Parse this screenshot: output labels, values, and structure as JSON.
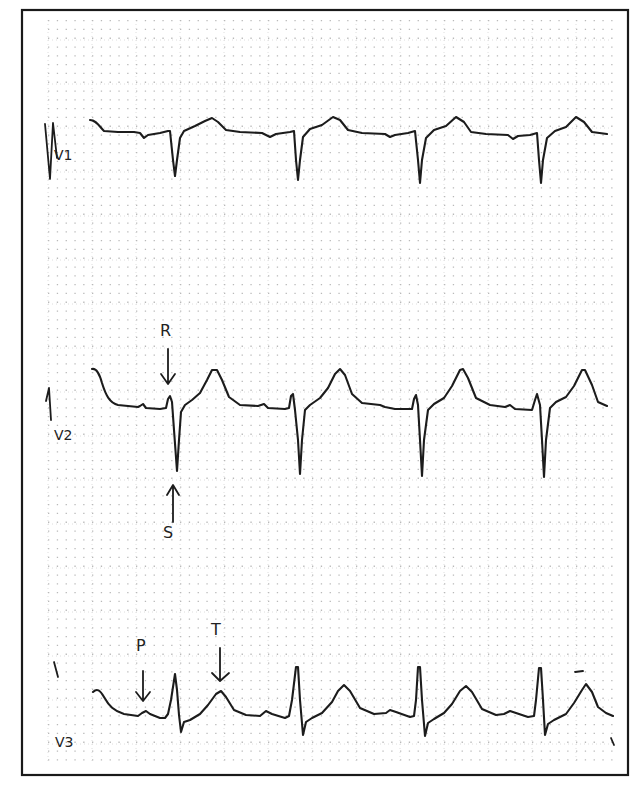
{
  "figure": {
    "type": "ecg-strip",
    "colors": {
      "trace": "#1c1c1c",
      "grid_dot": "#b9b9b9",
      "grid_major": "#d6d6d6",
      "frame": "#1a1a1a",
      "background": "#ffffff"
    },
    "frame": {
      "x": 22,
      "y": 10,
      "w": 606,
      "h": 765
    },
    "grid": {
      "x0": 48,
      "y0": 20,
      "x1": 612,
      "y1": 764,
      "minor": 8.8,
      "major": 44
    }
  },
  "leads": [
    {
      "id": "V1",
      "label": "V1",
      "label_pos": [
        54,
        160
      ],
      "calibration": "M45 124 L50 179 L53 123 L57 158",
      "path": "M90 120 C96 120 99 126 104 131 L118 132 L134 132 L140 133 L144 138 L148 135 L160 133 L168 131 L170 131 L173 160 L175 176 L177 160 L180 138 L184 131 L195 126 L205 121 L212 118 L218 122 L226 130 L240 132 L262 133 L270 137 L276 134 L290 132 L294 131 L296 160 L298 180 L300 160 L303 137 L310 129 L322 125 L333 117 L340 120 L348 130 L362 133 L385 134 L390 137 L395 135 L408 133 L415 131 L418 160 L420 183 L422 160 L426 138 L434 130 L446 126 L456 117 L464 122 L471 132 L486 134 L508 135 L513 139 L518 136 L530 135 L537 133 L539 160 L541 183 L543 160 L547 138 L555 131 L566 127 L576 117 L584 122 L592 132 L607 134"
    },
    {
      "id": "V2",
      "label": "V2",
      "label_pos": [
        54,
        440
      ],
      "calibration": "M46 401 L49 388 L51 420",
      "path": "M92 369 C96 368 99 372 102 383 C106 396 110 403 118 405 L138 407 L140 406 L143 404 L146 408 L160 409 L166 408 L168 399 L170 396 L172 402 L174 430 L177 471 L179 440 L181 412 L185 405 L192 400 L200 393 L207 380 L212 370 L217 370 L222 380 L229 397 L240 405 L258 406 L264 404 L268 408 L285 409 L289 408 L291 396 L293 394 L295 410 L298 440 L300 474 L302 440 L305 410 L310 405 L320 398 L328 388 L335 374 L340 369 L345 375 L352 394 L362 403 L380 405 L385 407 L395 409 L412 409 L414 399 L416 395 L418 405 L420 440 L422 476 L424 440 L428 410 L434 404 L444 398 L452 386 L460 370 L463 369 L468 378 L476 398 L490 405 L505 407 L510 405 L515 409 L532 410 L535 400 L537 394 L540 405 L542 440 L544 477 L546 440 L550 408 L556 402 L566 397 L574 386 L582 370 L585 370 L592 385 L598 402 L607 406"
    },
    {
      "id": "V3",
      "label": "V3",
      "label_pos": [
        55,
        747
      ],
      "calibration": "M54 662 L58 677",
      "path": "M93 692 C97 688 100 690 104 697 C109 706 114 711 124 714 L138 716 L142 713 L146 711 L150 714 L160 718 L165 718 L168 714 L171 700 L175 674 L177 690 L179 715 L181 732 L184 722 L190 720 L200 714 L208 705 L216 694 L221 691 L226 697 L234 710 L246 715 L260 716 L266 711 L272 714 L285 718 L289 716 L292 700 L296 667 L298 667 L300 700 L303 735 L306 722 L312 718 L322 713 L332 702 L338 691 L344 685 L350 691 L360 708 L374 714 L386 713 L390 710 L396 712 L410 717 L414 716 L416 700 L418 667 L420 667 L422 700 L425 736 L428 723 L434 719 L444 713 L452 704 L460 691 L466 686 L472 692 L482 709 L496 715 L504 714 L510 711 L516 713 L528 717 L534 716 L536 700 L539 668 L541 668 L543 700 L545 735 L548 724 L554 720 L566 714 L574 703 L582 690 L586 684 L592 692 L598 707 L606 713 L613 716"
    }
  ],
  "annotations": [
    {
      "id": "R",
      "text": "R",
      "text_pos": [
        160,
        336
      ],
      "arrow": "M168 349 L168 383 M161 374 L168 384 L175 374",
      "points_to": "R wave, lead V2"
    },
    {
      "id": "S",
      "text": "S",
      "text_pos": [
        163,
        538
      ],
      "arrow": "M173 522 L173 487 M167 495 L173 485 L179 495",
      "points_to": "S wave, lead V2"
    },
    {
      "id": "P",
      "text": "P",
      "text_pos": [
        136,
        651
      ],
      "arrow": "M143 671 L143 700 M136 692 L143 701 L150 692",
      "points_to": "P wave, lead V3"
    },
    {
      "id": "T",
      "text": "T",
      "text_pos": [
        211,
        635
      ],
      "arrow": "M220 648 L220 680 M212 673 L220 681 L229 673",
      "points_to": "T wave, lead V3"
    }
  ],
  "extra_marks": [
    {
      "name": "dash-mark",
      "path": "M575 672 L583 671"
    },
    {
      "name": "tick-mark",
      "path": "M611 738 L614 745"
    }
  ]
}
